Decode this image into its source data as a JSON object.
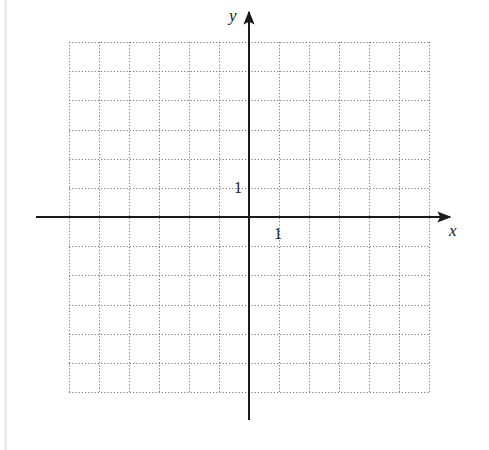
{
  "diagram": {
    "type": "coordinate-grid",
    "x_axis_label": "x",
    "y_axis_label": "y",
    "x_tick_label": "1",
    "y_tick_label": "1",
    "x_range": [
      -6,
      6
    ],
    "y_range": [
      -6,
      6
    ],
    "grid_step": 1,
    "grid_style": "dotted",
    "colors": {
      "axis": "#1a1a1a",
      "grid": "#777777",
      "background": "#ffffff"
    }
  }
}
